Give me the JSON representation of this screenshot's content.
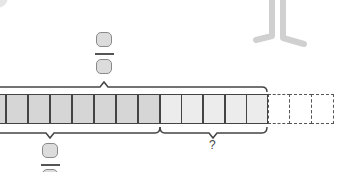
{
  "diagram": {
    "type": "fraction-tape-diagram",
    "shaded_cells": 8,
    "light_cells": 5,
    "dashed_cells": 3,
    "top_brace_label": "fraction (blank numerator / blank denominator)",
    "bottom_left_brace_label": "fraction (blank numerator / blank denominator)",
    "bottom_right_brace_label": "?",
    "colors": {
      "shaded": "#d6d6d6",
      "light": "#ececec",
      "border": "#444444",
      "answer_box": "#dcdcdc"
    }
  },
  "labels": {
    "question_mark": "?"
  }
}
